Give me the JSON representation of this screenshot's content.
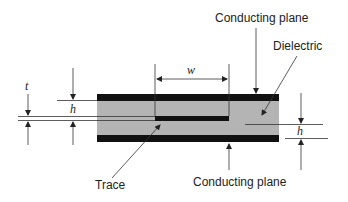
{
  "diagram": {
    "colors": {
      "conductor": "#111111",
      "dielectric": "#b4b4b4",
      "line": "#333333",
      "background": "#ffffff"
    },
    "labels": {
      "conducting_plane_top": "Conducting plane",
      "dielectric": "Dielectric",
      "trace": "Trace",
      "conducting_plane_bottom": "Conducting plane"
    },
    "dimensions": {
      "trace_thickness": "t",
      "height_left": "h",
      "trace_width": "w",
      "height_right": "h"
    }
  }
}
